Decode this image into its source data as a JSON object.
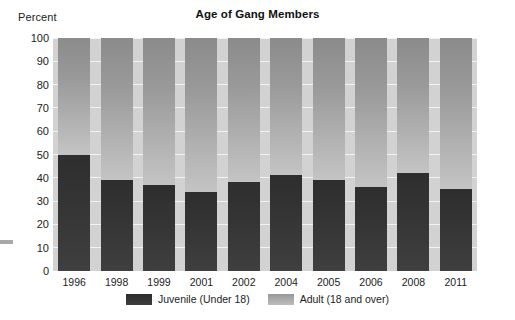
{
  "chart_data": {
    "type": "bar",
    "title": "Age of Gang Members",
    "subtitle": "",
    "xlabel": "",
    "ylabel": "Percent",
    "ylim": [
      0,
      100
    ],
    "yticks": [
      0,
      10,
      20,
      30,
      40,
      50,
      60,
      70,
      80,
      90,
      100
    ],
    "grid": true,
    "stacked": true,
    "legend_position": "bottom",
    "categories": [
      "1996",
      "1998",
      "1999",
      "2001",
      "2002",
      "2004",
      "2005",
      "2006",
      "2008",
      "2011"
    ],
    "series": [
      {
        "name": "Juvenile (Under 18)",
        "color": "#333333",
        "values": [
          50,
          39,
          37,
          34,
          38,
          41,
          39,
          36,
          42,
          35
        ]
      },
      {
        "name": "Adult (18 and over)",
        "color": "#a0a0a0",
        "values": [
          50,
          61,
          63,
          66,
          62,
          59,
          61,
          64,
          58,
          65
        ]
      }
    ],
    "plot_background": "#d2d2d2",
    "gridline_color": "#f2f2f2"
  },
  "axis": {
    "y_title": "Percent"
  }
}
